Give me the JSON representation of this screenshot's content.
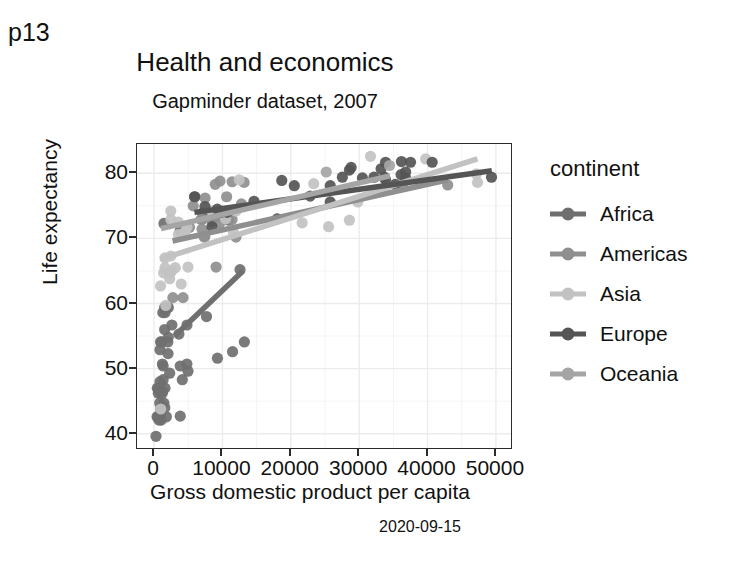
{
  "slide": {
    "label": "p13"
  },
  "chart_data": {
    "type": "scatter",
    "title": "Health and economics",
    "subtitle": "Gapminder dataset, 2007",
    "caption": "2020-09-15",
    "xlabel": "Gross domestic product per capita",
    "ylabel": "Life expectancy",
    "xlim": [
      -2500,
      52500
    ],
    "ylim": [
      37.5,
      84.5
    ],
    "xticks": [
      0,
      10000,
      20000,
      30000,
      40000,
      50000
    ],
    "xtick_labels": [
      "0",
      "10000",
      "20000",
      "30000",
      "40000",
      "50000"
    ],
    "yticks": [
      40,
      50,
      60,
      70,
      80
    ],
    "ytick_labels": [
      "40",
      "50",
      "60",
      "70",
      "80"
    ],
    "grid": true,
    "legend_position": "right",
    "legend_title": "continent",
    "colors": {
      "Africa": "#6f6f6f",
      "Americas": "#8f8f8f",
      "Asia": "#c2c2c2",
      "Europe": "#555555",
      "Oceania": "#a5a5a5"
    },
    "series": [
      {
        "name": "Africa",
        "color": "#6f6f6f",
        "points": [
          [
            975,
            43.8
          ],
          [
            5937,
            76.4
          ],
          [
            1441,
            72.3
          ],
          [
            3823,
            42.7
          ],
          [
            4811,
            56.7
          ],
          [
            1217,
            50.7
          ],
          [
            2042,
            52.3
          ],
          [
            4959,
            49.6
          ],
          [
            3822,
            50.4
          ],
          [
            823,
            44.7
          ],
          [
            4797,
            50.7
          ],
          [
            1441,
            44.7
          ],
          [
            12570,
            65.2
          ],
          [
            1217,
            46.5
          ],
          [
            13206,
            54.1
          ],
          [
            3632,
            55.3
          ],
          [
            1544,
            59.4
          ],
          [
            2082,
            54.8
          ],
          [
            7093,
            73.9
          ],
          [
            1327,
            48.3
          ],
          [
            942,
            54.1
          ],
          [
            579,
            42.6
          ],
          [
            1598,
            58.6
          ],
          [
            1544,
            56.0
          ],
          [
            2082,
            59.4
          ],
          [
            863,
            46.4
          ],
          [
            1598,
            47.0
          ],
          [
            1091,
            54.1
          ],
          [
            926,
            43.0
          ],
          [
            3820,
            71.2
          ],
          [
            1042,
            42.1
          ],
          [
            1803,
            42.6
          ],
          [
            10956,
            72.8
          ],
          [
            4126,
            48.3
          ],
          [
            2013,
            54.1
          ],
          [
            706,
            42.1
          ],
          [
            2602,
            56.7
          ],
          [
            277,
            39.6
          ],
          [
            1569,
            44.0
          ],
          [
            619,
            46.9
          ],
          [
            9270,
            51.6
          ],
          [
            469,
            47.0
          ],
          [
            2280,
            49.3
          ],
          [
            1271,
            58.6
          ],
          [
            619,
            46.2
          ],
          [
            7670,
            58.0
          ],
          [
            863,
            52.9
          ],
          [
            1327,
            50.4
          ],
          [
            430,
            42.6
          ],
          [
            1201,
            46.2
          ],
          [
            11478,
            52.6
          ],
          [
            1713,
            59.4
          ],
          [
            863,
            48.0
          ]
        ]
      },
      {
        "name": "Americas",
        "color": "#8f8f8f",
        "points": [
          [
            12779,
            75.3
          ],
          [
            9066,
            65.6
          ],
          [
            9646,
            72.4
          ],
          [
            13172,
            78.6
          ],
          [
            7007,
            72.9
          ],
          [
            9645,
            78.8
          ],
          [
            8948,
            78.3
          ],
          [
            6873,
            72.9
          ],
          [
            5728,
            75.0
          ],
          [
            5186,
            71.7
          ],
          [
            7409,
            70.3
          ],
          [
            4229,
            60.9
          ],
          [
            11978,
            70.2
          ],
          [
            2749,
            60.9
          ],
          [
            7320,
            70.2
          ],
          [
            8458,
            72.6
          ],
          [
            7458,
            76.2
          ],
          [
            11404,
            72.9
          ],
          [
            11416,
            78.7
          ],
          [
            7007,
            71.4
          ],
          [
            36319,
            78.2
          ],
          [
            42952,
            78.2
          ],
          [
            10611,
            76.4
          ],
          [
            9809,
            73.7
          ],
          [
            8948,
            73.3
          ]
        ]
      },
      {
        "name": "Asia",
        "color": "#c2c2c2",
        "points": [
          [
            974,
            43.8
          ],
          [
            29796,
            75.6
          ],
          [
            1391,
            64.7
          ],
          [
            1713,
            59.7
          ],
          [
            4959,
            65.6
          ],
          [
            39725,
            82.2
          ],
          [
            2452,
            72.9
          ],
          [
            3540,
            72.5
          ],
          [
            4471,
            70.6
          ],
          [
            2280,
            64.7
          ],
          [
            11605,
            70.9
          ],
          [
            4519,
            71.0
          ],
          [
            12450,
            79.0
          ],
          [
            31656,
            82.6
          ],
          [
            28569,
            72.8
          ],
          [
            47307,
            78.6
          ],
          [
            2441,
            67.3
          ],
          [
            4811,
            71.7
          ],
          [
            2280,
            63.8
          ],
          [
            1593,
            65.5
          ],
          [
            10461,
            73.0
          ],
          [
            1593,
            67.0
          ],
          [
            3095,
            65.5
          ],
          [
            944,
            62.7
          ],
          [
            3970,
            63.0
          ],
          [
            21655,
            72.4
          ],
          [
            11977,
            74.2
          ],
          [
            23348,
            78.4
          ],
          [
            2602,
            65.0
          ],
          [
            47143,
            79.9
          ],
          [
            3540,
            70.6
          ],
          [
            8458,
            74.2
          ],
          [
            25523,
            71.8
          ],
          [
            2441,
            74.2
          ]
        ]
      },
      {
        "name": "Europe",
        "color": "#555555",
        "points": [
          [
            5937,
            76.4
          ],
          [
            36126,
            79.8
          ],
          [
            33693,
            79.4
          ],
          [
            7446,
            74.9
          ],
          [
            10681,
            74.0
          ],
          [
            14619,
            75.7
          ],
          [
            22833,
            76.5
          ],
          [
            35278,
            78.3
          ],
          [
            33207,
            80.7
          ],
          [
            30470,
            79.3
          ],
          [
            32170,
            79.4
          ],
          [
            27538,
            79.4
          ],
          [
            18009,
            73.0
          ],
          [
            36180,
            81.8
          ],
          [
            40676,
            81.7
          ],
          [
            28569,
            80.5
          ],
          [
            9254,
            74.5
          ],
          [
            36797,
            79.3
          ],
          [
            25768,
            78.1
          ],
          [
            49357,
            79.4
          ],
          [
            36798,
            80.2
          ],
          [
            33859,
            79.0
          ],
          [
            20510,
            78.1
          ],
          [
            9786,
            74.0
          ],
          [
            18678,
            78.9
          ],
          [
            25768,
            75.6
          ],
          [
            28821,
            80.9
          ],
          [
            33859,
            81.7
          ],
          [
            37506,
            81.7
          ],
          [
            8458,
            71.8
          ]
        ]
      },
      {
        "name": "Oceania",
        "color": "#a5a5a5",
        "points": [
          [
            34435,
            81.2
          ],
          [
            25185,
            80.2
          ]
        ]
      }
    ],
    "trend_lines": [
      {
        "name": "Africa",
        "color": "#6f6f6f",
        "x0": 3000,
        "y0": 55.0,
        "x1": 13000,
        "y1": 65.0
      },
      {
        "name": "Americas",
        "color": "#8f8f8f",
        "x0": 2700,
        "y0": 69.6,
        "x1": 43000,
        "y1": 79.0
      },
      {
        "name": "Asia",
        "color": "#c2c2c2",
        "x0": 900,
        "y0": 66.8,
        "x1": 47300,
        "y1": 82.2
      },
      {
        "name": "Europe",
        "color": "#555555",
        "x0": 5900,
        "y0": 74.0,
        "x1": 49400,
        "y1": 80.4
      },
      {
        "name": "Oceania",
        "color": "#a5a5a5",
        "x0": 1000,
        "y0": 71.5,
        "x1": 34500,
        "y1": 79.6
      }
    ]
  },
  "legend": {
    "title": "continent",
    "items": [
      {
        "label": "Africa",
        "color": "#6f6f6f"
      },
      {
        "label": "Americas",
        "color": "#8f8f8f"
      },
      {
        "label": "Asia",
        "color": "#c2c2c2"
      },
      {
        "label": "Europe",
        "color": "#555555"
      },
      {
        "label": "Oceania",
        "color": "#a5a5a5"
      }
    ]
  }
}
